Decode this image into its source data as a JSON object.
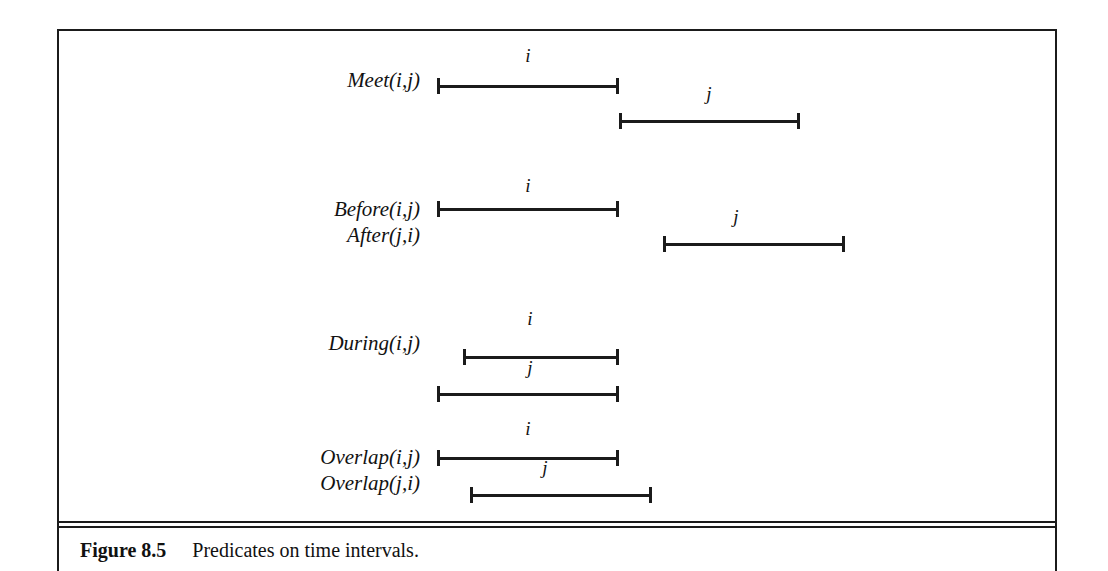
{
  "figure": {
    "caption_label": "Figure 8.5",
    "caption_text": "Predicates on time intervals.",
    "line_color": "#1b1b1b",
    "text_color": "#121212",
    "background": "#ffffff"
  },
  "chart_data": {
    "type": "diagram",
    "title": "Predicates on time intervals",
    "xlabel": "",
    "ylabel": "",
    "axis": "time (left to right, unlabeled)",
    "grid": false,
    "legend": false,
    "rows": [
      {
        "id": "meet",
        "labels": [
          "Meet(i,j)"
        ],
        "label_top": 67,
        "intervals": [
          {
            "name": "i",
            "start": 437,
            "end": 619,
            "top": 78,
            "name_x": 528,
            "name_y": 46
          },
          {
            "name": "j",
            "start": 619,
            "end": 800,
            "top": 113,
            "name_x": 709,
            "name_y": 84
          }
        ]
      },
      {
        "id": "before-after",
        "labels": [
          "Before(i,j)",
          "After(j,i)"
        ],
        "label_top": 196,
        "intervals": [
          {
            "name": "i",
            "start": 437,
            "end": 619,
            "top": 201,
            "name_x": 528,
            "name_y": 176
          },
          {
            "name": "j",
            "start": 663,
            "end": 845,
            "top": 236,
            "name_x": 736,
            "name_y": 207
          }
        ]
      },
      {
        "id": "during",
        "labels": [
          "During(i,j)"
        ],
        "label_top": 330,
        "intervals": [
          {
            "name": "i",
            "start": 463,
            "end": 619,
            "top": 349,
            "name_x": 530,
            "name_y": 309
          },
          {
            "name": "j",
            "start": 437,
            "end": 619,
            "top": 386,
            "name_x": 530,
            "name_y": 358
          }
        ]
      },
      {
        "id": "overlap",
        "labels": [
          "Overlap(i,j)",
          "Overlap(j,i)"
        ],
        "label_top": 444,
        "intervals": [
          {
            "name": "i",
            "start": 437,
            "end": 619,
            "top": 450,
            "name_x": 528,
            "name_y": 419
          },
          {
            "name": "j",
            "start": 470,
            "end": 652,
            "top": 487,
            "name_x": 545,
            "name_y": 458
          }
        ]
      }
    ]
  }
}
